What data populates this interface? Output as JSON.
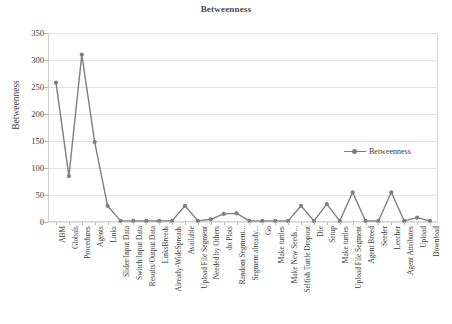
{
  "chart_data": {
    "type": "line",
    "title": "Betweenness",
    "xlabel": "",
    "ylabel": "Betweenness",
    "ylim": [
      0,
      350
    ],
    "yticks": [
      0,
      50,
      100,
      150,
      200,
      250,
      300,
      350
    ],
    "grid": true,
    "legend_position": "right",
    "series_color": "#7f7f7f",
    "categories": [
      "ABM",
      "Globals",
      "Procedures",
      "Agents",
      "Links",
      "Slider/Input Data",
      "Switch/Input Data",
      "Results/Output Data",
      "LinksBreeds",
      "Already-WideSpreads",
      "Available",
      "Upload File Segment",
      "Needed by Others",
      "do Plots",
      "Random Segment...",
      "Segment already...",
      "Go",
      "Make turtles",
      "Make New Seeds...",
      "Selfish Turtle Dropout",
      "Die",
      "Setup",
      "Make turtles",
      "Upload File Segment",
      "Agent Breed",
      "Seeder",
      "Leecher",
      "Agent Attributes",
      "Upload",
      "Download"
    ],
    "series": [
      {
        "name": "Betweenness",
        "values": [
          258,
          85,
          310,
          148,
          30,
          2,
          2,
          2,
          2,
          2,
          30,
          2,
          5,
          15,
          16,
          2,
          2,
          2,
          2,
          30,
          2,
          33,
          2,
          55,
          2,
          2,
          55,
          2,
          8,
          2
        ]
      }
    ]
  },
  "legend": {
    "entries": [
      {
        "label": "Betweenness"
      }
    ]
  }
}
